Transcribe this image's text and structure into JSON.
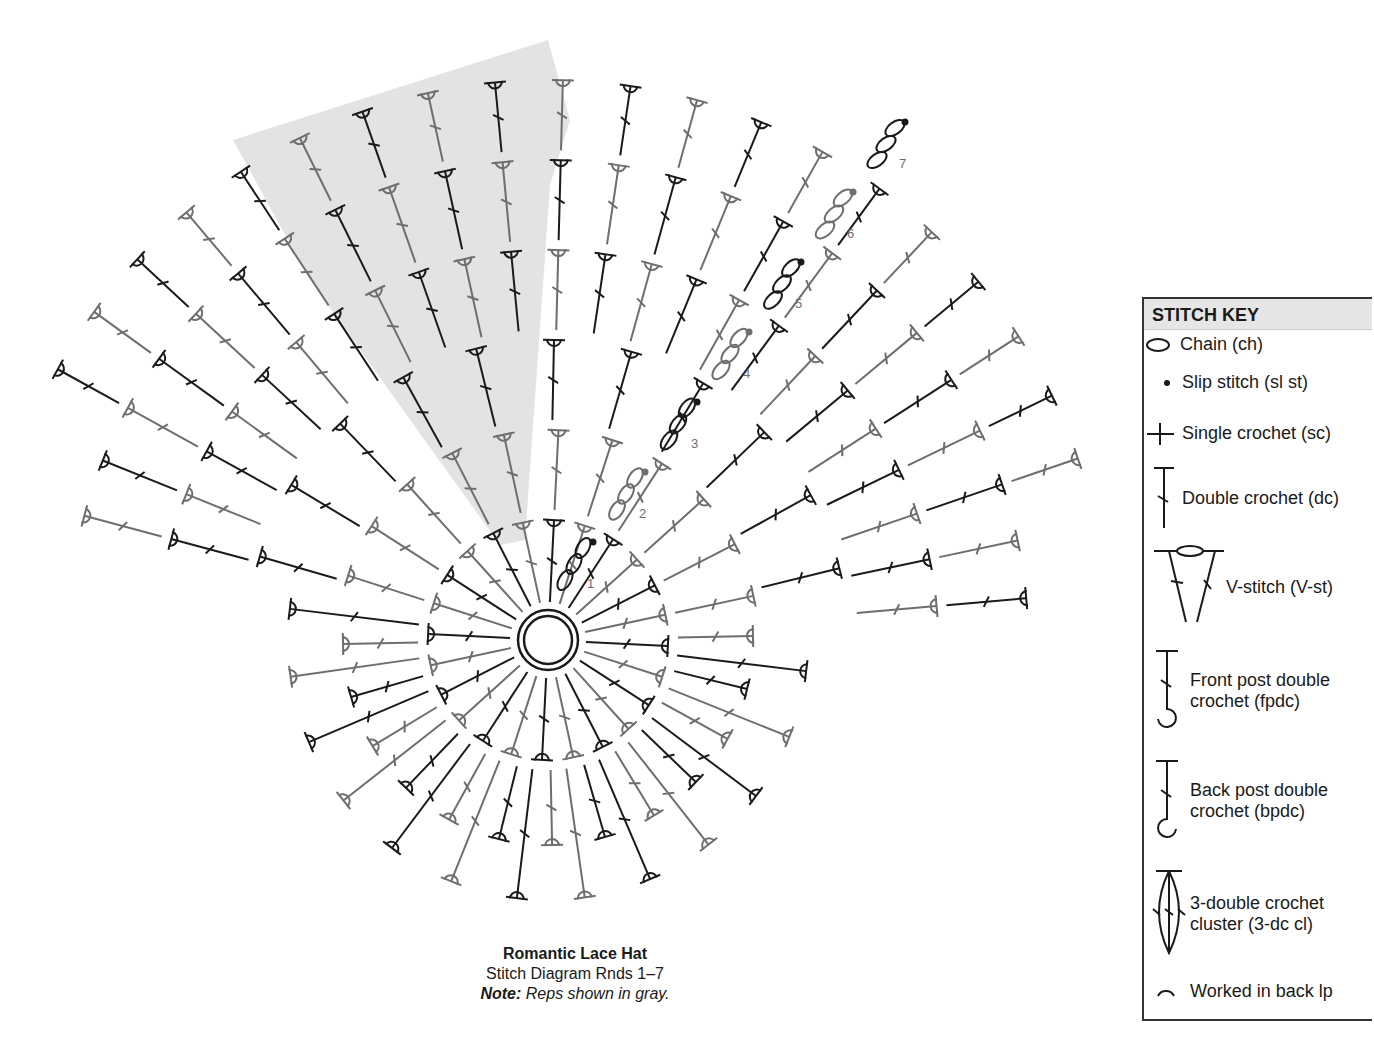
{
  "caption": {
    "title": "Romantic Lace Hat",
    "subtitle": "Stitch Diagram Rnds 1–7",
    "note_label": "Note:",
    "note_text": " Reps shown in gray."
  },
  "stitch_key": {
    "header": "STITCH KEY",
    "items": [
      {
        "icon": "chain-icon",
        "label": "Chain (ch)"
      },
      {
        "icon": "slip-stitch-icon",
        "label": "Slip stitch (sl st)"
      },
      {
        "icon": "single-crochet-icon",
        "label": "Single crochet (sc)"
      },
      {
        "icon": "double-crochet-icon",
        "label": "Double crochet (dc)"
      },
      {
        "icon": "v-stitch-icon",
        "label": "V-stitch (V-st)"
      },
      {
        "icon": "front-post-dc-icon",
        "label": "Front post double",
        "label2": "crochet (fpdc)"
      },
      {
        "icon": "back-post-dc-icon",
        "label": "Back post double",
        "label2": "crochet (bpdc)"
      },
      {
        "icon": "cluster-icon",
        "label": "3-double crochet",
        "label2": "cluster (3-dc cl)"
      },
      {
        "icon": "back-loop-icon",
        "label": "Worked in back lp"
      }
    ]
  },
  "diagram": {
    "center": [
      548,
      640
    ],
    "round_labels": [
      "1",
      "2",
      "3",
      "4",
      "5",
      "6",
      "7"
    ],
    "colors": {
      "main": "#1a1a1a",
      "rep": "#6e6e6e",
      "shade": "#e3e3e3"
    },
    "inner_spokes": 24,
    "outer_fan": {
      "start_deg": 195,
      "end_deg": 355,
      "count": 24
    }
  }
}
